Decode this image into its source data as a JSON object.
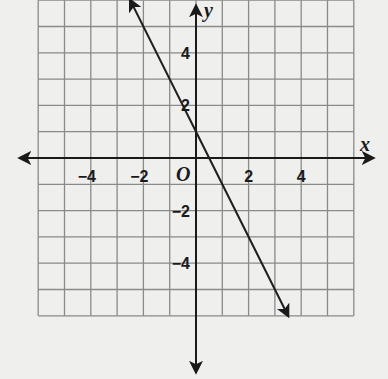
{
  "chart_data": {
    "type": "line",
    "title": "",
    "xlabel": "x",
    "ylabel": "y",
    "xlim": [
      -6,
      6
    ],
    "ylim": [
      -6,
      6
    ],
    "grid": true,
    "x_tick_labels": [
      {
        "value": -4,
        "label": "−4"
      },
      {
        "value": -2,
        "label": "−2"
      },
      {
        "value": 2,
        "label": "2"
      },
      {
        "value": 4,
        "label": "4"
      }
    ],
    "y_tick_labels": [
      {
        "value": 4,
        "label": "4"
      },
      {
        "value": 2,
        "label": "2"
      },
      {
        "value": -2,
        "label": "−2"
      },
      {
        "value": -4,
        "label": "−4"
      }
    ],
    "origin_label": "O",
    "series": [
      {
        "name": "line",
        "equation": "y = -2x + 1",
        "slope": -2,
        "intercept": 1,
        "x": [
          -2.5,
          3.5
        ],
        "y": [
          6,
          -6
        ],
        "arrows": "both"
      }
    ]
  },
  "labels": {
    "x_axis": "x",
    "y_axis": "y",
    "origin": "O",
    "x_ticks": [
      "−4",
      "−2",
      "2",
      "4"
    ],
    "y_ticks": [
      "4",
      "2",
      "−2",
      "−4"
    ]
  },
  "colors": {
    "background": "#efefed",
    "grid": "#8a8a8a",
    "axis": "#1a1a1a",
    "line": "#1f1f1f"
  }
}
